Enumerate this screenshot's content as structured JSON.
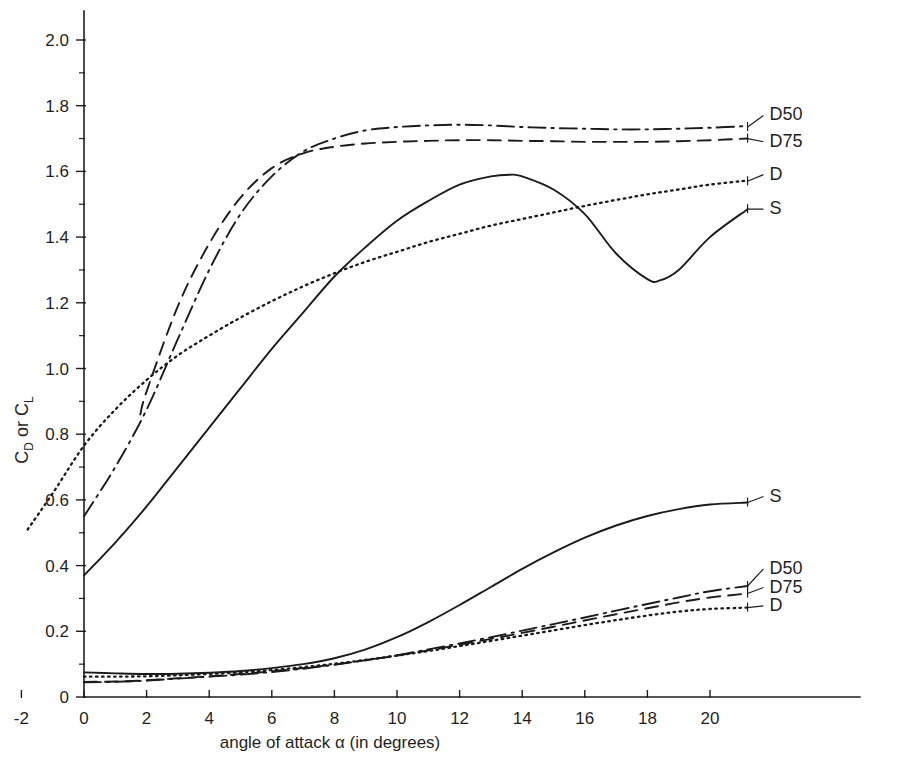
{
  "chart_data": {
    "type": "line",
    "title": "",
    "xlabel": "angle of attack  α  (in degrees)",
    "ylabel": "C_D or C_L",
    "ylabel_parts": {
      "c1": "C",
      "sub1": "D",
      "mid": " or ",
      "c2": "C",
      "sub2": "L"
    },
    "xlim": [
      -3,
      22.5
    ],
    "ylim": [
      0,
      2.1
    ],
    "xticks": [
      -2,
      0,
      2,
      4,
      6,
      8,
      10,
      12,
      14,
      16,
      18,
      20
    ],
    "xtick_labels": [
      "-2",
      "0",
      "2",
      "4",
      "6",
      "8",
      "10",
      "12",
      "14",
      "16",
      "18",
      "20"
    ],
    "yticks": [
      0,
      0.2,
      0.4,
      0.6,
      0.8,
      1.0,
      1.2,
      1.4,
      1.6,
      1.8,
      2.0
    ],
    "ytick_labels": [
      "0",
      "0.2",
      "0.4",
      "0.6",
      "0.8",
      "1.0",
      "1.2",
      "1.4",
      "1.6",
      "1.8",
      "2.0"
    ],
    "ytick_minor_step": 0.1,
    "grid": false,
    "legend_position": "right-inline-labels",
    "series": [
      {
        "name": "CL-S",
        "label": "S",
        "group": "lift",
        "style": "solid",
        "label_xy": [
          21.9,
          1.47
        ],
        "anchor_xy": [
          21.2,
          1.485
        ],
        "x": [
          0,
          1,
          2,
          3,
          4,
          5,
          6,
          7,
          8,
          9,
          10,
          11,
          12,
          13,
          13.6,
          14,
          15,
          16,
          17,
          18,
          18.4,
          19,
          20,
          21.2
        ],
        "y": [
          0.37,
          0.47,
          0.58,
          0.7,
          0.82,
          0.94,
          1.06,
          1.17,
          1.28,
          1.37,
          1.45,
          1.51,
          1.56,
          1.585,
          1.59,
          1.585,
          1.545,
          1.47,
          1.35,
          1.272,
          1.268,
          1.3,
          1.4,
          1.485
        ]
      },
      {
        "name": "CL-D",
        "label": "D",
        "group": "lift",
        "style": "dotted",
        "label_xy": [
          21.9,
          1.575
        ],
        "anchor_xy": [
          21.2,
          1.57
        ],
        "x": [
          -1.8,
          -1,
          0,
          1,
          2,
          3,
          4,
          5,
          6,
          7,
          8,
          9,
          10,
          11,
          12,
          13,
          14,
          15,
          16,
          17,
          18,
          19,
          20,
          21.2
        ],
        "y": [
          0.51,
          0.62,
          0.765,
          0.875,
          0.965,
          1.04,
          1.1,
          1.155,
          1.205,
          1.25,
          1.29,
          1.325,
          1.355,
          1.385,
          1.41,
          1.435,
          1.455,
          1.475,
          1.495,
          1.513,
          1.53,
          1.545,
          1.56,
          1.572
        ]
      },
      {
        "name": "CL-D75",
        "label": "D75",
        "group": "lift",
        "style": "dashed",
        "label_xy": [
          21.9,
          1.675
        ],
        "anchor_xy": [
          21.2,
          1.7
        ],
        "x": [
          1.8,
          2,
          3,
          4,
          5,
          6,
          7,
          8,
          9,
          10,
          11,
          12,
          13,
          14,
          15,
          16,
          17,
          18,
          19,
          20,
          21.2
        ],
        "y": [
          0.86,
          0.93,
          1.19,
          1.38,
          1.52,
          1.61,
          1.655,
          1.675,
          1.685,
          1.69,
          1.693,
          1.695,
          1.695,
          1.693,
          1.692,
          1.69,
          1.69,
          1.69,
          1.692,
          1.695,
          1.7
        ]
      },
      {
        "name": "CL-D50",
        "label": "D50",
        "group": "lift",
        "style": "dashdot",
        "label_xy": [
          21.9,
          1.755
        ],
        "anchor_xy": [
          21.2,
          1.735
        ],
        "x": [
          0,
          1,
          2,
          3,
          4,
          5,
          6,
          7,
          8,
          9,
          10,
          11,
          12,
          13,
          14,
          15,
          16,
          17,
          18,
          19,
          20,
          21.2
        ],
        "y": [
          0.55,
          0.7,
          0.875,
          1.09,
          1.3,
          1.47,
          1.585,
          1.66,
          1.7,
          1.725,
          1.735,
          1.74,
          1.742,
          1.74,
          1.735,
          1.732,
          1.73,
          1.728,
          1.728,
          1.73,
          1.733,
          1.738
        ]
      },
      {
        "name": "CD-S",
        "label": "S",
        "group": "drag",
        "style": "solid",
        "label_xy": [
          21.9,
          0.595
        ],
        "anchor_xy": [
          21.2,
          0.592
        ],
        "x": [
          0,
          1,
          2,
          3,
          4,
          5,
          6,
          7,
          8,
          9,
          10,
          11,
          12,
          13,
          14,
          15,
          16,
          17,
          18,
          19,
          20,
          21.2
        ],
        "y": [
          0.075,
          0.072,
          0.07,
          0.071,
          0.074,
          0.079,
          0.088,
          0.1,
          0.118,
          0.145,
          0.182,
          0.228,
          0.28,
          0.335,
          0.39,
          0.44,
          0.485,
          0.522,
          0.551,
          0.572,
          0.586,
          0.592
        ]
      },
      {
        "name": "CD-D50",
        "label": "D50",
        "group": "drag",
        "style": "dashdot",
        "label_xy": [
          21.9,
          0.375
        ],
        "anchor_xy": [
          21.2,
          0.338
        ],
        "x": [
          0,
          1,
          2,
          3,
          4,
          5,
          6,
          7,
          8,
          9,
          10,
          11,
          12,
          13,
          14,
          15,
          16,
          17,
          18,
          19,
          20,
          21.2
        ],
        "y": [
          0.045,
          0.046,
          0.05,
          0.056,
          0.062,
          0.068,
          0.076,
          0.086,
          0.098,
          0.112,
          0.127,
          0.145,
          0.163,
          0.182,
          0.202,
          0.222,
          0.242,
          0.263,
          0.283,
          0.303,
          0.322,
          0.338
        ]
      },
      {
        "name": "CD-D75",
        "label": "D75",
        "group": "drag",
        "style": "dashed",
        "label_xy": [
          21.9,
          0.318
        ],
        "anchor_xy": [
          21.2,
          0.315
        ],
        "x": [
          0,
          1,
          2,
          3,
          4,
          5,
          6,
          7,
          8,
          9,
          10,
          11,
          12,
          13,
          14,
          15,
          16,
          17,
          18,
          19,
          20,
          21.2
        ],
        "y": [
          0.046,
          0.047,
          0.051,
          0.057,
          0.063,
          0.07,
          0.078,
          0.088,
          0.099,
          0.112,
          0.126,
          0.142,
          0.159,
          0.177,
          0.195,
          0.214,
          0.233,
          0.252,
          0.27,
          0.288,
          0.303,
          0.315
        ]
      },
      {
        "name": "CD-D",
        "label": "D",
        "group": "drag",
        "style": "dotted",
        "label_xy": [
          21.9,
          0.262
        ],
        "anchor_xy": [
          21.2,
          0.272
        ],
        "x": [
          0,
          1,
          2,
          3,
          4,
          5,
          6,
          7,
          8,
          9,
          10,
          11,
          12,
          13,
          14,
          15,
          16,
          17,
          18,
          19,
          20,
          21.2
        ],
        "y": [
          0.062,
          0.062,
          0.063,
          0.066,
          0.07,
          0.075,
          0.082,
          0.091,
          0.101,
          0.113,
          0.126,
          0.14,
          0.155,
          0.171,
          0.187,
          0.203,
          0.219,
          0.234,
          0.248,
          0.26,
          0.268,
          0.272
        ]
      }
    ]
  },
  "geometry": {
    "origin_px": [
      84,
      697
    ],
    "x_unit_px": 31.3,
    "y_unit_px": 328.5,
    "axis_top_px": 11,
    "axis_right_px": 860
  }
}
